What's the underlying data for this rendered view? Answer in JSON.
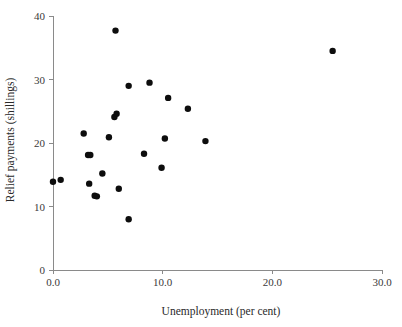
{
  "chart_data": {
    "type": "scatter",
    "title": "",
    "xlabel": "Unemployment (per cent)",
    "ylabel": "Relief payments (shillings)",
    "xlim": [
      0,
      30
    ],
    "ylim": [
      0,
      40
    ],
    "xticks": [
      0,
      10,
      20,
      30
    ],
    "xtick_labels": [
      "0.0",
      "10.0",
      "20.0",
      "30.0"
    ],
    "yticks": [
      0,
      10,
      20,
      30,
      40
    ],
    "ytick_labels": [
      "0",
      "10",
      "20",
      "30",
      "40"
    ],
    "grid": false,
    "legend": null,
    "marker": "filled-circle",
    "marker_color": "#0d0d0d",
    "marker_size": 3.2,
    "n_points": 27,
    "points": [
      {
        "x": 0.0,
        "y": 13.9
      },
      {
        "x": 0.7,
        "y": 14.2
      },
      {
        "x": 2.8,
        "y": 21.5
      },
      {
        "x": 3.2,
        "y": 18.1
      },
      {
        "x": 3.4,
        "y": 18.1
      },
      {
        "x": 3.3,
        "y": 13.6
      },
      {
        "x": 3.8,
        "y": 11.7
      },
      {
        "x": 4.0,
        "y": 11.6
      },
      {
        "x": 4.5,
        "y": 15.2
      },
      {
        "x": 5.1,
        "y": 20.9
      },
      {
        "x": 5.6,
        "y": 24.1
      },
      {
        "x": 5.8,
        "y": 24.6
      },
      {
        "x": 5.7,
        "y": 37.7
      },
      {
        "x": 6.0,
        "y": 12.8
      },
      {
        "x": 6.9,
        "y": 8.0
      },
      {
        "x": 6.9,
        "y": 29.0
      },
      {
        "x": 8.3,
        "y": 18.3
      },
      {
        "x": 8.8,
        "y": 29.5
      },
      {
        "x": 9.9,
        "y": 16.1
      },
      {
        "x": 10.2,
        "y": 20.7
      },
      {
        "x": 10.5,
        "y": 27.1
      },
      {
        "x": 12.3,
        "y": 25.4
      },
      {
        "x": 13.9,
        "y": 20.3
      },
      {
        "x": 25.5,
        "y": 34.5
      }
    ]
  },
  "axes": {
    "x_axis_title": "Unemployment (per cent)",
    "y_axis_title": "Relief payments (shillings)"
  },
  "colors": {
    "marker": "#0d0d0d",
    "axis": "#8a8a8a",
    "text": "#2a2a2a",
    "background": "#ffffff"
  }
}
